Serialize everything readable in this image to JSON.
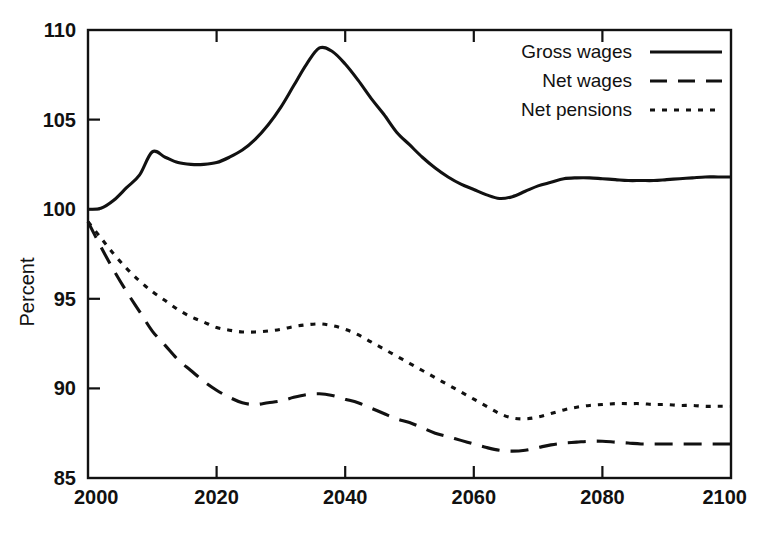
{
  "chart_data": {
    "type": "line",
    "title": "",
    "subtitle": "",
    "xlabel": "",
    "ylabel": "Percent",
    "xlim": [
      2000,
      2100
    ],
    "ylim": [
      85,
      110
    ],
    "xticks": [
      2000,
      2020,
      2040,
      2060,
      2080,
      2100
    ],
    "xticklabels": [
      "2000",
      "2020",
      "2040",
      "2060",
      "2080",
      "2100"
    ],
    "yticks": [
      85,
      90,
      95,
      100,
      105,
      110
    ],
    "yticklabels": [
      "85",
      "90",
      "95",
      "100",
      "105",
      "110"
    ],
    "grid": false,
    "legend_position": "top-right",
    "annotations": [],
    "x": [
      2000,
      2002,
      2004,
      2006,
      2008,
      2010,
      2012,
      2014,
      2016,
      2018,
      2020,
      2022,
      2024,
      2026,
      2028,
      2030,
      2032,
      2034,
      2036,
      2038,
      2040,
      2042,
      2044,
      2046,
      2048,
      2050,
      2052,
      2054,
      2056,
      2058,
      2060,
      2062,
      2064,
      2066,
      2068,
      2070,
      2072,
      2074,
      2076,
      2078,
      2080,
      2082,
      2084,
      2086,
      2088,
      2090,
      2092,
      2094,
      2096,
      2098,
      2100
    ],
    "series": [
      {
        "name": "Gross wages",
        "style": "solid",
        "values": [
          100.0,
          100.05,
          100.5,
          101.2,
          101.9,
          103.2,
          102.9,
          102.6,
          102.5,
          102.5,
          102.6,
          102.9,
          103.3,
          103.9,
          104.7,
          105.7,
          106.9,
          108.1,
          109.0,
          108.8,
          108.1,
          107.2,
          106.2,
          105.3,
          104.3,
          103.6,
          102.9,
          102.3,
          101.8,
          101.4,
          101.1,
          100.8,
          100.6,
          100.7,
          101.0,
          101.3,
          101.5,
          101.7,
          101.75,
          101.75,
          101.7,
          101.65,
          101.6,
          101.6,
          101.6,
          101.65,
          101.7,
          101.75,
          101.8,
          101.8,
          101.8
        ]
      },
      {
        "name": "Net wages",
        "style": "dashed",
        "values": [
          99.3,
          97.9,
          96.6,
          95.4,
          94.3,
          93.2,
          92.4,
          91.6,
          91.0,
          90.4,
          89.9,
          89.5,
          89.2,
          89.1,
          89.2,
          89.3,
          89.5,
          89.65,
          89.7,
          89.6,
          89.4,
          89.2,
          88.9,
          88.6,
          88.3,
          88.1,
          87.8,
          87.5,
          87.3,
          87.1,
          86.9,
          86.7,
          86.55,
          86.5,
          86.55,
          86.7,
          86.85,
          86.95,
          87.0,
          87.05,
          87.05,
          87.0,
          86.95,
          86.9,
          86.9,
          86.9,
          86.9,
          86.9,
          86.9,
          86.9,
          86.9
        ]
      },
      {
        "name": "Net pensions",
        "style": "dotted",
        "values": [
          99.3,
          98.4,
          97.5,
          96.7,
          96.0,
          95.4,
          94.9,
          94.4,
          94.0,
          93.7,
          93.4,
          93.25,
          93.15,
          93.15,
          93.2,
          93.3,
          93.45,
          93.55,
          93.6,
          93.5,
          93.3,
          93.0,
          92.6,
          92.2,
          91.8,
          91.4,
          91.0,
          90.6,
          90.2,
          89.8,
          89.4,
          89.0,
          88.6,
          88.35,
          88.3,
          88.4,
          88.6,
          88.8,
          88.95,
          89.05,
          89.1,
          89.15,
          89.15,
          89.15,
          89.1,
          89.1,
          89.05,
          89.05,
          89.0,
          89.0,
          89.0
        ]
      }
    ]
  },
  "legend": {
    "entries": [
      {
        "label": "Gross wages",
        "style": "solid"
      },
      {
        "label": "Net wages",
        "style": "dashed"
      },
      {
        "label": "Net pensions",
        "style": "dotted"
      }
    ]
  },
  "axes": {
    "y_title": "Percent"
  }
}
